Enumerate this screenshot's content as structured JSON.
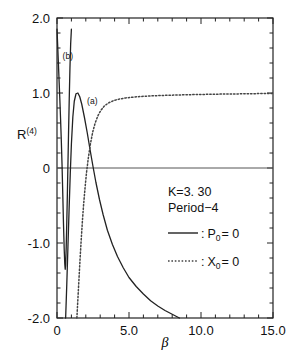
{
  "chart_data": {
    "type": "line",
    "title": "",
    "xlabel": "β",
    "ylabel": "R",
    "ylabel_superscript": "(4)",
    "xlim": [
      0,
      15
    ],
    "ylim": [
      -2.0,
      2.0
    ],
    "grid": false,
    "x_ticks_major": [
      "0",
      "5.0",
      "10.0",
      "15.0"
    ],
    "x_ticks_major_values": [
      0,
      5,
      10,
      15
    ],
    "x_minor_step": 1.0,
    "y_ticks_major": [
      "2.0",
      "1.0",
      "0",
      "-1.0",
      "-2.0"
    ],
    "y_ticks_major_values": [
      2.0,
      1.0,
      0,
      -1.0,
      -2.0
    ],
    "y_minor_step": 0.2,
    "zero_line": true,
    "annotations": [
      {
        "text": "(b)",
        "x": 0.75,
        "y": 1.45
      },
      {
        "text": "(a)",
        "x": 2.45,
        "y": 0.86
      }
    ],
    "series": [
      {
        "name": "P0 = 0 branch (b)",
        "label": "(b)",
        "style": "solid",
        "color": "#222222",
        "points": [
          [
            0.0,
            1.85
          ],
          [
            0.05,
            1.62
          ],
          [
            0.1,
            1.38
          ],
          [
            0.15,
            1.14
          ],
          [
            0.2,
            0.9
          ],
          [
            0.25,
            0.64
          ],
          [
            0.3,
            0.36
          ],
          [
            0.35,
            0.04
          ],
          [
            0.4,
            -0.34
          ],
          [
            0.45,
            -0.74
          ],
          [
            0.5,
            -1.08
          ],
          [
            0.54,
            -1.28
          ],
          [
            0.57,
            -1.35
          ],
          [
            0.6,
            -1.3
          ],
          [
            0.64,
            -1.05
          ],
          [
            0.68,
            -0.72
          ],
          [
            0.72,
            -0.35
          ],
          [
            0.76,
            0.05
          ],
          [
            0.8,
            0.45
          ],
          [
            0.85,
            0.92
          ],
          [
            0.9,
            1.34
          ],
          [
            0.95,
            1.66
          ],
          [
            1.0,
            1.85
          ]
        ]
      },
      {
        "name": "P0 = 0 branch (a)",
        "label": "(a)",
        "style": "solid",
        "color": "#222222",
        "points": [
          [
            0.6,
            -2.0
          ],
          [
            0.68,
            -1.55
          ],
          [
            0.76,
            -1.05
          ],
          [
            0.84,
            -0.55
          ],
          [
            0.92,
            -0.08
          ],
          [
            1.0,
            0.32
          ],
          [
            1.1,
            0.68
          ],
          [
            1.2,
            0.89
          ],
          [
            1.32,
            0.99
          ],
          [
            1.45,
            1.0
          ],
          [
            1.58,
            0.95
          ],
          [
            1.72,
            0.85
          ],
          [
            1.9,
            0.68
          ],
          [
            2.1,
            0.47
          ],
          [
            2.3,
            0.24
          ],
          [
            2.5,
            0.02
          ],
          [
            2.7,
            -0.19
          ],
          [
            2.95,
            -0.42
          ],
          [
            3.2,
            -0.62
          ],
          [
            3.5,
            -0.83
          ],
          [
            3.85,
            -1.02
          ],
          [
            4.2,
            -1.18
          ],
          [
            4.6,
            -1.33
          ],
          [
            5.0,
            -1.46
          ],
          [
            5.5,
            -1.58
          ],
          [
            6.0,
            -1.68
          ],
          [
            6.5,
            -1.77
          ],
          [
            7.0,
            -1.84
          ],
          [
            7.5,
            -1.9
          ],
          [
            8.0,
            -1.95
          ],
          [
            8.5,
            -2.0
          ]
        ]
      },
      {
        "name": "X0 = 0",
        "style": "dotted",
        "color": "#444444",
        "points": [
          [
            1.38,
            -2.0
          ],
          [
            1.45,
            -1.75
          ],
          [
            1.52,
            -1.5
          ],
          [
            1.6,
            -1.22
          ],
          [
            1.68,
            -0.96
          ],
          [
            1.76,
            -0.72
          ],
          [
            1.85,
            -0.48
          ],
          [
            1.95,
            -0.26
          ],
          [
            2.05,
            -0.06
          ],
          [
            2.18,
            0.14
          ],
          [
            2.32,
            0.32
          ],
          [
            2.48,
            0.48
          ],
          [
            2.65,
            0.6
          ],
          [
            2.85,
            0.7
          ],
          [
            3.05,
            0.77
          ],
          [
            3.3,
            0.83
          ],
          [
            3.6,
            0.87
          ],
          [
            3.95,
            0.9
          ],
          [
            4.35,
            0.92
          ],
          [
            4.8,
            0.935
          ],
          [
            5.3,
            0.945
          ],
          [
            5.9,
            0.955
          ],
          [
            6.6,
            0.962
          ],
          [
            7.4,
            0.968
          ],
          [
            8.3,
            0.973
          ],
          [
            9.3,
            0.978
          ],
          [
            10.4,
            0.982
          ],
          [
            11.6,
            0.986
          ],
          [
            12.9,
            0.989
          ],
          [
            14.0,
            0.992
          ],
          [
            15.0,
            0.995
          ]
        ]
      }
    ]
  },
  "legend": {
    "caption_line1": "K=3. 30",
    "caption_line2": "Period−4",
    "entries": [
      {
        "style": "solid",
        "separator": ":",
        "symbol": "P",
        "subscript": "0",
        "equals": "= 0"
      },
      {
        "style": "dotted",
        "separator": ":",
        "symbol": "X",
        "subscript": "0",
        "equals": "= 0"
      }
    ]
  },
  "axis": {
    "y_label_main": "R",
    "y_label_sup": "(4)",
    "x_label": "β"
  },
  "colors": {
    "background": "#ffffff",
    "axis": "#222222",
    "curve_solid": "#222222",
    "curve_dotted": "#444444"
  }
}
